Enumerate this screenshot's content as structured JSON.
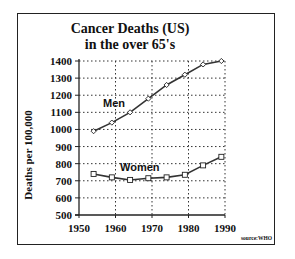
{
  "chart_data": {
    "type": "line",
    "title": "Cancer Deaths (US)",
    "subtitle": "in the over 65's",
    "xlabel": "",
    "ylabel": "Deaths per 100,000",
    "x_ticks": [
      1950,
      1960,
      1970,
      1980,
      1990
    ],
    "y_ticks": [
      500,
      600,
      700,
      800,
      900,
      1000,
      1100,
      1200,
      1300,
      1400
    ],
    "xlim": [
      1950,
      1990
    ],
    "ylim": [
      500,
      1400
    ],
    "grid": true,
    "x": [
      1954,
      1959,
      1964,
      1969,
      1974,
      1979,
      1984,
      1989
    ],
    "series": [
      {
        "name": "Men",
        "marker": "diamond",
        "values": [
          990,
          1040,
          1100,
          1180,
          1260,
          1320,
          1380,
          1400
        ]
      },
      {
        "name": "Women",
        "marker": "square",
        "values": [
          740,
          720,
          705,
          715,
          720,
          735,
          790,
          840
        ]
      }
    ],
    "annotations": [
      "Men",
      "Women"
    ],
    "source": "source:WHO"
  },
  "labels": {
    "title_line1": "Cancer Deaths (US)",
    "title_line2": "in the over 65's",
    "ylabel": "Deaths per 100,000",
    "source": "source:WHO"
  }
}
